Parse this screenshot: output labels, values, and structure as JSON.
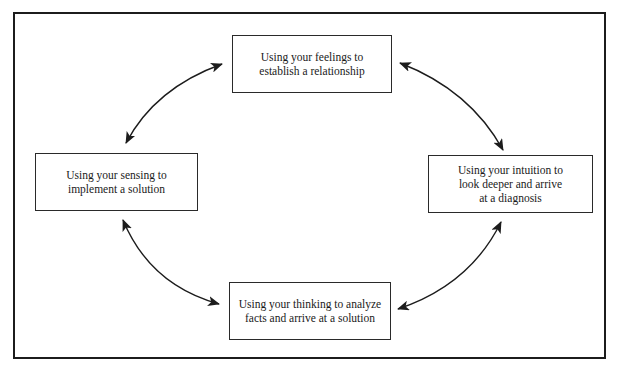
{
  "diagram": {
    "type": "cycle",
    "nodes": [
      {
        "id": "top",
        "label": "Using your feelings to\nestablish a relationship"
      },
      {
        "id": "right",
        "label": "Using your intuition to\nlook deeper and arrive\nat a diagnosis"
      },
      {
        "id": "bottom",
        "label": "Using your thinking to analyze\nfacts and arrive at a solution"
      },
      {
        "id": "left",
        "label": "Using your sensing to\nimplement a solution"
      }
    ],
    "edges": [
      {
        "from": "top",
        "to": "right",
        "style": "bidirectional-curved-arrow"
      },
      {
        "from": "right",
        "to": "bottom",
        "style": "bidirectional-curved-arrow"
      },
      {
        "from": "bottom",
        "to": "left",
        "style": "bidirectional-curved-arrow"
      },
      {
        "from": "left",
        "to": "top",
        "style": "bidirectional-curved-arrow"
      }
    ],
    "colors": {
      "stroke": "#1c1c1c",
      "background": "#ffffff",
      "text": "#1a1a1a"
    }
  }
}
